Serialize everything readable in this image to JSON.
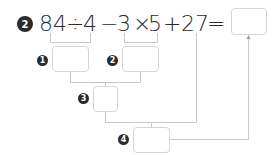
{
  "problem": {
    "number": "2",
    "tokens": [
      "84",
      "÷",
      "4",
      "−",
      "3",
      "×",
      "5",
      "+",
      "27",
      "="
    ]
  },
  "steps": [
    {
      "label": "1",
      "value": ""
    },
    {
      "label": "2",
      "value": ""
    },
    {
      "label": "3",
      "value": ""
    },
    {
      "label": "4",
      "value": ""
    }
  ],
  "answer": {
    "value": ""
  },
  "colors": {
    "text": "#2b2b2b",
    "line": "#c8c8c8",
    "box_border": "#d6d6d6"
  }
}
